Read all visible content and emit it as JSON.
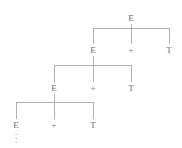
{
  "figure": {
    "canvas": {
      "width": 182,
      "height": 148
    },
    "colors": {
      "background": "#ffffff",
      "line": "#b0b0b0",
      "text": "#6b6b6b"
    },
    "ellipsis_glyph": "."
  },
  "tree": {
    "root_label": "E",
    "levels": [
      {
        "index": 1,
        "parent_label": "E",
        "parent_x": 131,
        "parent_y": 14,
        "bar_y": 28,
        "children_y": 46,
        "children": [
          {
            "label": "E",
            "x": 93,
            "role": "nonterminal-left"
          },
          {
            "label": "+",
            "x": 131,
            "role": "operator"
          },
          {
            "label": "T",
            "x": 169,
            "role": "nonterminal-right"
          }
        ]
      },
      {
        "index": 2,
        "parent_label": "E",
        "parent_x": 93,
        "parent_y": 46,
        "bar_y": 65,
        "children_y": 84,
        "children": [
          {
            "label": "E",
            "x": 54,
            "role": "nonterminal-left"
          },
          {
            "label": "+",
            "x": 93,
            "role": "operator"
          },
          {
            "label": "T",
            "x": 131,
            "role": "nonterminal-right"
          }
        ]
      },
      {
        "index": 3,
        "parent_label": "E",
        "parent_x": 54,
        "parent_y": 84,
        "bar_y": 102,
        "children_y": 121,
        "children": [
          {
            "label": "E",
            "x": 16,
            "role": "nonterminal-left"
          },
          {
            "label": "+",
            "x": 54,
            "role": "operator"
          },
          {
            "label": "T",
            "x": 93,
            "role": "nonterminal-right"
          }
        ]
      }
    ],
    "continuation": {
      "under_label": "E",
      "x": 16,
      "y": 130,
      "marker": "vertical-ellipsis"
    }
  }
}
